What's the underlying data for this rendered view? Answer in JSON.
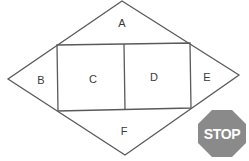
{
  "diagram": {
    "type": "rhombus-with-inscribed-rectangle",
    "regions": [
      {
        "id": "A",
        "label": "A",
        "position": "top triangle"
      },
      {
        "id": "B",
        "label": "B",
        "position": "left triangle"
      },
      {
        "id": "C",
        "label": "C",
        "position": "left square"
      },
      {
        "id": "D",
        "label": "D",
        "position": "right square"
      },
      {
        "id": "E",
        "label": "E",
        "position": "right triangle"
      },
      {
        "id": "F",
        "label": "F",
        "position": "bottom triangle"
      }
    ],
    "stop_sign": {
      "label": "STOP",
      "fill": "#8a8a8a",
      "text_color": "#ffffff"
    },
    "colors": {
      "line": "#5a5a5a",
      "label": "#3a3a3a",
      "background": "#ffffff"
    }
  }
}
